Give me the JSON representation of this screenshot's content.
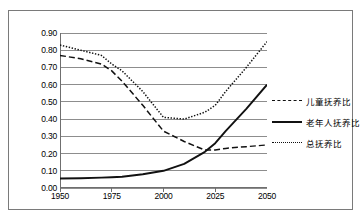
{
  "chart_data": {
    "type": "line",
    "title": "",
    "subtitle": "",
    "xlabel": "",
    "ylabel": "",
    "xlim": [
      1950,
      2050
    ],
    "ylim": [
      0.0,
      0.9
    ],
    "grid": true,
    "legend_position": "right",
    "x_ticks": [
      "1950",
      "1975",
      "2000",
      "2025",
      "2050"
    ],
    "y_ticks": [
      "0.90",
      "0.80",
      "0.70",
      "0.60",
      "0.50",
      "0.40",
      "0.30",
      "0.20",
      "0.10",
      "0.00"
    ],
    "x": [
      1950,
      1960,
      1970,
      1975,
      1980,
      1990,
      2000,
      2010,
      2020,
      2025,
      2030,
      2040,
      2050
    ],
    "series": [
      {
        "name": "儿童抚养比",
        "style": "dashed",
        "color": "#111111",
        "values": [
          0.77,
          0.75,
          0.72,
          0.68,
          0.62,
          0.48,
          0.33,
          0.27,
          0.22,
          0.22,
          0.23,
          0.24,
          0.25
        ]
      },
      {
        "name": "老年人抚养比",
        "style": "solid",
        "color": "#111111",
        "values": [
          0.055,
          0.057,
          0.06,
          0.062,
          0.065,
          0.08,
          0.1,
          0.14,
          0.21,
          0.26,
          0.33,
          0.46,
          0.6
        ]
      },
      {
        "name": "总抚养比",
        "style": "dotted",
        "color": "#111111",
        "values": [
          0.83,
          0.8,
          0.77,
          0.72,
          0.68,
          0.56,
          0.41,
          0.4,
          0.44,
          0.48,
          0.56,
          0.7,
          0.85
        ]
      }
    ]
  },
  "legend": {
    "items": [
      {
        "label": "儿童抚养比",
        "style": "dashed"
      },
      {
        "label": "老年人抚养比",
        "style": "solid"
      },
      {
        "label": "总抚养比",
        "style": "dotted"
      }
    ]
  }
}
